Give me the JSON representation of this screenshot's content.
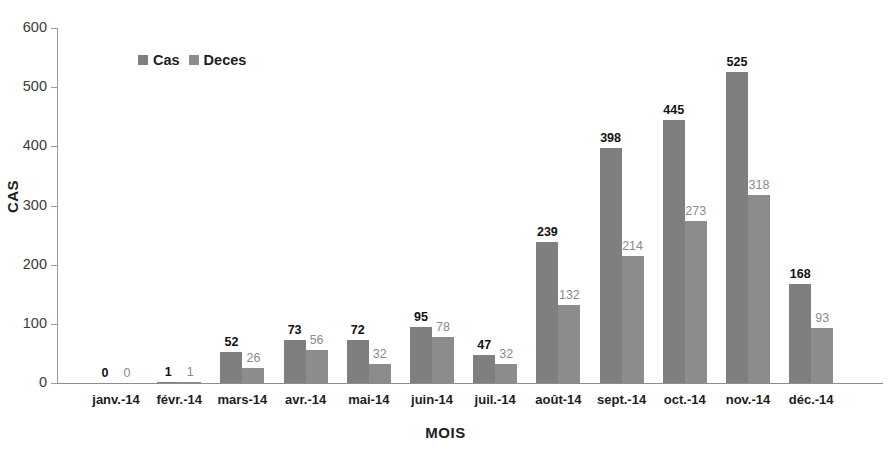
{
  "chart_data": {
    "type": "bar",
    "title": "",
    "xlabel": "MOIS",
    "ylabel": "CAS",
    "ylim": [
      0,
      600
    ],
    "yticks": [
      0,
      100,
      200,
      300,
      400,
      500,
      600
    ],
    "grid": false,
    "legend_position": "top-left-inside",
    "categories": [
      "janv.-14",
      "févr.-14",
      "mars-14",
      "avr.-14",
      "mai-14",
      "juin-14",
      "juil.-14",
      "août-14",
      "sept.-14",
      "oct.-14",
      "nov.-14",
      "déc.-14"
    ],
    "series": [
      {
        "name": "Cas",
        "color": "#7f7f7f",
        "values": [
          0,
          1,
          52,
          73,
          72,
          95,
          47,
          239,
          398,
          445,
          525,
          168
        ]
      },
      {
        "name": "Deces",
        "color": "#8c8c8c",
        "values": [
          0,
          1,
          26,
          56,
          32,
          78,
          32,
          132,
          214,
          273,
          318,
          93
        ]
      }
    ]
  },
  "axis": {
    "y_title": "CAS",
    "x_title": "MOIS"
  },
  "colors": {
    "cas": "#7f7f7f",
    "deces": "#8c8c8c",
    "axis": "#9a9a9a",
    "label_cas": "#111111",
    "label_deces": "#8a8a8a"
  }
}
